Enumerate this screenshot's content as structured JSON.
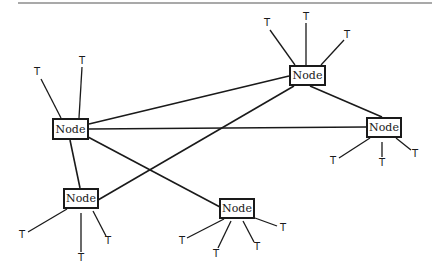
{
  "diagram": {
    "type": "network-topology",
    "header_rule_color": "#555555",
    "line_color": "#1a1a1a",
    "nodes": [
      {
        "id": "n_left",
        "label": "Node",
        "x": 52,
        "y": 118,
        "w": 37,
        "h": 22
      },
      {
        "id": "n_top_right",
        "label": "Node",
        "x": 289,
        "y": 65,
        "w": 37,
        "h": 21
      },
      {
        "id": "n_right",
        "label": "Node",
        "x": 366,
        "y": 117,
        "w": 36,
        "h": 21
      },
      {
        "id": "n_bottom_left",
        "label": "Node",
        "x": 63,
        "y": 188,
        "w": 36,
        "h": 21
      },
      {
        "id": "n_bottom_center",
        "label": "Node",
        "x": 219,
        "y": 198,
        "w": 36,
        "h": 21
      }
    ],
    "links": [
      {
        "from": "n_left",
        "to": "n_top_right",
        "x1": 89,
        "y1": 124,
        "x2": 289,
        "y2": 76
      },
      {
        "from": "n_left",
        "to": "n_right",
        "x1": 89,
        "y1": 129,
        "x2": 366,
        "y2": 127
      },
      {
        "from": "n_left",
        "to": "n_bottom_center",
        "x1": 88,
        "y1": 137,
        "x2": 220,
        "y2": 207
      },
      {
        "from": "n_left",
        "to": "n_bottom_left",
        "x1": 70,
        "y1": 140,
        "x2": 80,
        "y2": 188
      },
      {
        "from": "n_top_right",
        "to": "n_right",
        "x1": 310,
        "y1": 86,
        "x2": 382,
        "y2": 117
      },
      {
        "from": "n_top_right",
        "to": "n_bottom_left",
        "x1": 294,
        "y1": 86,
        "x2": 98,
        "y2": 200
      }
    ],
    "terminals": [
      {
        "node": "n_left",
        "label": "T",
        "x": 37,
        "y": 72,
        "lx1": 41,
        "ly1": 79,
        "lx2": 61,
        "ly2": 118
      },
      {
        "node": "n_left",
        "label": "T",
        "x": 82,
        "y": 61,
        "lx1": 82,
        "ly1": 67,
        "lx2": 79,
        "ly2": 118
      },
      {
        "node": "n_top_right",
        "label": "T",
        "x": 267,
        "y": 23,
        "lx1": 270,
        "ly1": 30,
        "lx2": 295,
        "ly2": 65
      },
      {
        "node": "n_top_right",
        "label": "T",
        "x": 306,
        "y": 17,
        "lx1": 306,
        "ly1": 23,
        "lx2": 306,
        "ly2": 65
      },
      {
        "node": "n_top_right",
        "label": "T",
        "x": 347,
        "y": 35,
        "lx1": 344,
        "ly1": 40,
        "lx2": 321,
        "ly2": 65
      },
      {
        "node": "n_right",
        "label": "T",
        "x": 333,
        "y": 161,
        "lx1": 339,
        "ly1": 158,
        "lx2": 370,
        "ly2": 138
      },
      {
        "node": "n_right",
        "label": "T",
        "x": 382,
        "y": 163,
        "lx1": 382,
        "ly1": 157,
        "lx2": 382,
        "ly2": 142
      },
      {
        "node": "n_right",
        "label": "T",
        "x": 415,
        "y": 154,
        "lx1": 411,
        "ly1": 150,
        "lx2": 396,
        "ly2": 138
      },
      {
        "node": "n_bottom_left",
        "label": "T",
        "x": 22,
        "y": 235,
        "lx1": 28,
        "ly1": 232,
        "lx2": 67,
        "ly2": 209
      },
      {
        "node": "n_bottom_left",
        "label": "T",
        "x": 81,
        "y": 258,
        "lx1": 81,
        "ly1": 252,
        "lx2": 81,
        "ly2": 213
      },
      {
        "node": "n_bottom_left",
        "label": "T",
        "x": 108,
        "y": 241,
        "lx1": 106,
        "ly1": 236,
        "lx2": 93,
        "ly2": 211
      },
      {
        "node": "n_bottom_center",
        "label": "T",
        "x": 182,
        "y": 241,
        "lx1": 187,
        "ly1": 238,
        "lx2": 224,
        "ly2": 219
      },
      {
        "node": "n_bottom_center",
        "label": "T",
        "x": 216,
        "y": 254,
        "lx1": 218,
        "ly1": 248,
        "lx2": 231,
        "ly2": 221
      },
      {
        "node": "n_bottom_center",
        "label": "T",
        "x": 257,
        "y": 247,
        "lx1": 254,
        "ly1": 242,
        "lx2": 243,
        "ly2": 221
      },
      {
        "node": "n_bottom_center",
        "label": "T",
        "x": 283,
        "y": 228,
        "lx1": 277,
        "ly1": 226,
        "lx2": 255,
        "ly2": 218
      }
    ]
  }
}
